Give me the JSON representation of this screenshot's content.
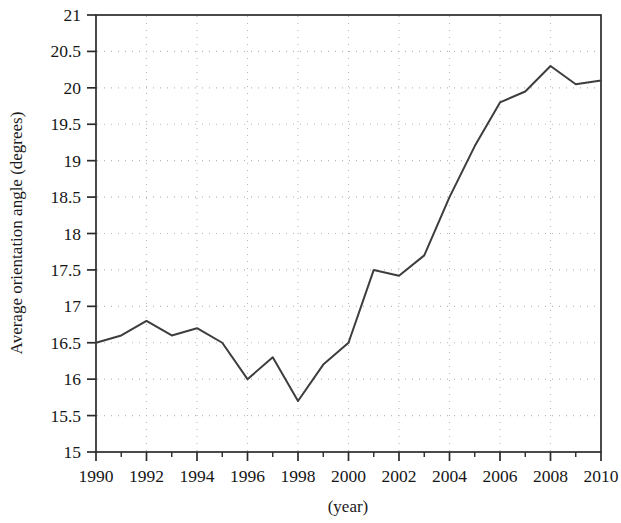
{
  "chart_data": {
    "type": "line",
    "title": "",
    "xlabel": "(year)",
    "ylabel": "Average orientation angle (degrees)",
    "x": [
      1990,
      1991,
      1992,
      1993,
      1994,
      1995,
      1996,
      1997,
      1998,
      1999,
      2000,
      2001,
      2002,
      2003,
      2004,
      2005,
      2006,
      2007,
      2008,
      2009,
      2010
    ],
    "values": [
      16.5,
      16.6,
      16.8,
      16.6,
      16.7,
      16.5,
      16.0,
      16.3,
      15.7,
      16.2,
      16.5,
      17.5,
      17.42,
      17.7,
      18.5,
      19.2,
      19.8,
      19.95,
      20.3,
      20.05,
      20.1
    ],
    "series": [
      {
        "name": "Average orientation angle",
        "values": [
          16.5,
          16.6,
          16.8,
          16.6,
          16.7,
          16.5,
          16.0,
          16.3,
          15.7,
          16.2,
          16.5,
          17.5,
          17.42,
          17.7,
          18.5,
          19.2,
          19.8,
          19.95,
          20.3,
          20.05,
          20.1
        ]
      }
    ],
    "xlim": [
      1990,
      2010
    ],
    "ylim": [
      15,
      21
    ],
    "y_ticks": [
      15,
      15.5,
      16,
      16.5,
      17,
      17.5,
      18,
      18.5,
      19,
      19.5,
      20,
      20.5,
      21
    ],
    "y_tick_labels": [
      "15",
      "15.5",
      "16",
      "16.5",
      "17",
      "17.5",
      "18",
      "18.5",
      "19",
      "19.5",
      "20",
      "20.5",
      "21"
    ],
    "x_ticks": [
      1990,
      1992,
      1994,
      1996,
      1998,
      2000,
      2002,
      2004,
      2006,
      2008,
      2010
    ],
    "x_tick_labels": [
      "1990",
      "1992",
      "1994",
      "1996",
      "1998",
      "2000",
      "2002",
      "2004",
      "2006",
      "2008",
      "2010"
    ],
    "x_minor_ticks": [
      1991,
      1993,
      1995,
      1997,
      1999,
      2001,
      2003,
      2005,
      2007,
      2009
    ],
    "grid": true,
    "grid_style": "dotted",
    "legend": null,
    "legend_position": "none",
    "annotations": [],
    "colors": {
      "line": "#3d3d3d",
      "axis": "#2b2b2b",
      "grid": "#b8b8b8",
      "background": "#ffffff",
      "text": "#161616"
    }
  }
}
